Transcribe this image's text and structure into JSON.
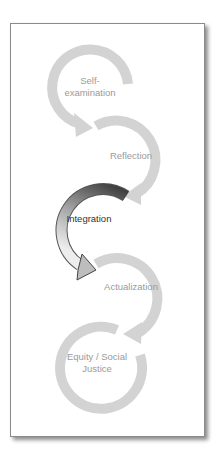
{
  "diagram": {
    "type": "cycle-of-stages",
    "colors": {
      "inactive_arc": "#d3d3d3",
      "inactive_text": "#9a9a9a",
      "active_arc_dark": "#3a3a3a",
      "active_arc_light": "#e6e6e6",
      "active_text": "#333333",
      "frame_border": "#8a8a8a"
    },
    "stages": [
      {
        "label": "Self-\nexamination",
        "line1": "Self-",
        "line2": "examination",
        "active": false
      },
      {
        "label": "Reflection",
        "line1": "Reflection",
        "active": false
      },
      {
        "label": "Integration",
        "line1": "Integration",
        "active": true
      },
      {
        "label": "Actualization",
        "line1": "Actualization",
        "active": false
      },
      {
        "label": "Equity / Social Justice",
        "line1": "Equity / Social",
        "line2": "Justice",
        "active": false
      }
    ]
  }
}
